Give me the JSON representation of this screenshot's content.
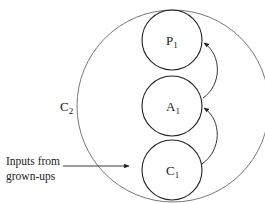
{
  "diagram": {
    "outer_circle": {
      "label": "C",
      "subscript": "2"
    },
    "inner_circles": [
      {
        "id": "P1",
        "label": "P",
        "subscript": "1"
      },
      {
        "id": "A1",
        "label": "A",
        "subscript": "1"
      },
      {
        "id": "C1",
        "label": "C",
        "subscript": "1"
      }
    ],
    "input": {
      "line1": "Inputs from",
      "line2": "grown-ups"
    },
    "arrows": [
      {
        "from": "C1",
        "to": "A1"
      },
      {
        "from": "A1",
        "to": "P1"
      }
    ],
    "colors": {
      "stroke": "#222222",
      "outer_stroke": "#555555",
      "background": "#ffffff"
    }
  }
}
